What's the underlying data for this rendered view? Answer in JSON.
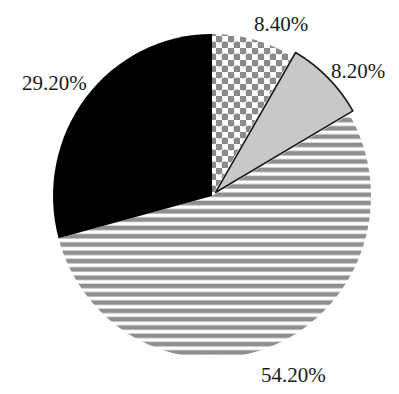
{
  "chart_data": {
    "type": "pie",
    "title": "",
    "start_angle_deg": 0,
    "direction": "clockwise",
    "slices": [
      {
        "label": "8.40%",
        "value": 8.4,
        "fill": "checker",
        "color": "#8a8a8a",
        "exploded": false
      },
      {
        "label": "8.20%",
        "value": 8.2,
        "fill": "solid-light-gray",
        "color": "#c8c8c8",
        "exploded": true
      },
      {
        "label": "54.20%",
        "value": 54.2,
        "fill": "horizontal-stripes",
        "color": "#8f8f8f",
        "exploded": false
      },
      {
        "label": "29.20%",
        "value": 29.2,
        "fill": "solid-black",
        "color": "#000000",
        "exploded": false
      }
    ],
    "legend": "none",
    "grid": false
  },
  "labels": {
    "slice_1": "8.40%",
    "slice_2": "8.20%",
    "slice_3": "54.20%",
    "slice_4": "29.20%"
  }
}
